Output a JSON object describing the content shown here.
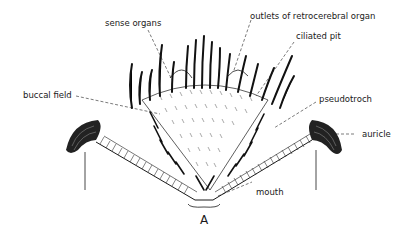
{
  "figure": {
    "panel_label": "A",
    "labels": {
      "sense_organs": "sense organs",
      "outlets": "outlets of retrocerebral organ",
      "ciliated_pit": "ciliated pit",
      "buccal_field": "buccal field",
      "pseudotroch": "pseudotroch",
      "auricle": "auricle",
      "mouth": "mouth"
    },
    "colors": {
      "ink": "#1a1a1a",
      "background": "#ffffff"
    }
  }
}
